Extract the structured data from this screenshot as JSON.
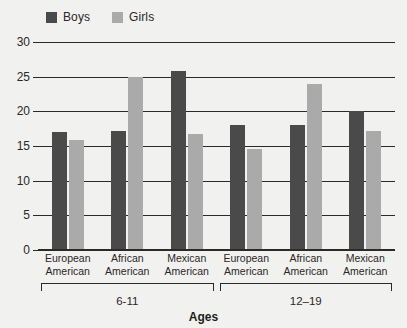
{
  "chart_data": {
    "type": "bar",
    "title": "",
    "xlabel": "Ages",
    "ylabel": "",
    "ylim": [
      0,
      30
    ],
    "yticks": [
      0,
      5,
      10,
      15,
      20,
      25,
      30
    ],
    "ytick_labels": [
      "0",
      "5",
      "10",
      "15",
      "20",
      "25",
      "30"
    ],
    "grid": true,
    "legend_position": "top-left",
    "categories": [
      "European American",
      "African American",
      "Mexican American",
      "European American",
      "African American",
      "Mexican American"
    ],
    "category_lines": [
      [
        "European",
        "American"
      ],
      [
        "African",
        "American"
      ],
      [
        "Mexican",
        "American"
      ],
      [
        "European",
        "American"
      ],
      [
        "African",
        "American"
      ],
      [
        "Mexican",
        "American"
      ]
    ],
    "groups": [
      {
        "label": "6-11",
        "categories": [
          0,
          1,
          2
        ]
      },
      {
        "label": "12–19",
        "categories": [
          3,
          4,
          5
        ]
      }
    ],
    "series": [
      {
        "name": "Boys",
        "color": "#4a4a4a",
        "values": [
          17,
          17.2,
          25.8,
          18,
          18,
          20
        ]
      },
      {
        "name": "Girls",
        "color": "#aaaaaa",
        "values": [
          15.8,
          25,
          16.7,
          14.6,
          23.9,
          17.2
        ]
      }
    ]
  },
  "legend": {
    "entries": [
      {
        "label": "Boys",
        "color": "#4a4a4a"
      },
      {
        "label": "Girls",
        "color": "#aaaaaa"
      }
    ]
  },
  "axis": {
    "x_title": "Ages"
  },
  "colors": {
    "background": "#f1f1f0",
    "axis": "#2c2927",
    "text": "#2a2726",
    "boys": "#4a4a4a",
    "girls": "#aaaaaa"
  }
}
